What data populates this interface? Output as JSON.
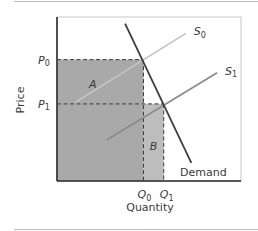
{
  "diagram": {
    "type": "supply-demand",
    "y_axis_label": "Price",
    "x_axis_label": "Quantity",
    "price_levels": [
      {
        "id": "P0",
        "base": "P",
        "sub": "0",
        "value": 0.74
      },
      {
        "id": "P1",
        "base": "P",
        "sub": "1",
        "value": 0.47
      }
    ],
    "quantity_levels": [
      {
        "id": "Q0",
        "base": "Q",
        "sub": "0",
        "value": 0.47
      },
      {
        "id": "Q1",
        "base": "Q",
        "sub": "1",
        "value": 0.58
      }
    ],
    "curves": [
      {
        "id": "S0",
        "base": "S",
        "sub": "0",
        "kind": "supply",
        "from": [
          0.1,
          0.48
        ],
        "to": [
          0.7,
          0.9
        ],
        "color": "#c4c4c4"
      },
      {
        "id": "S1",
        "base": "S",
        "sub": "1",
        "kind": "supply",
        "from": [
          0.27,
          0.25
        ],
        "to": [
          0.87,
          0.66
        ],
        "color": "#8a8a8a"
      },
      {
        "id": "Demand",
        "label": "Demand",
        "kind": "demand",
        "from": [
          0.37,
          0.96
        ],
        "to": [
          0.73,
          0.11
        ],
        "color": "#3e3e3e"
      }
    ],
    "areas": [
      {
        "id": "A",
        "label": "A",
        "x": [
          0,
          0.47
        ],
        "y": [
          0.47,
          0.74
        ],
        "color": "#a9a9a9"
      },
      {
        "id": "B",
        "label": "B",
        "x": [
          0.47,
          0.58
        ],
        "y": [
          0,
          0.47
        ],
        "color": "#bdbdbd"
      },
      {
        "id": "base",
        "label": "",
        "x": [
          0,
          0.47
        ],
        "y": [
          0,
          0.47
        ],
        "color": "#a9a9a9"
      }
    ],
    "colors": {
      "frame": "#c8c8c8",
      "axis": "#2a2a2a",
      "dash": "#3a3a3a"
    }
  }
}
